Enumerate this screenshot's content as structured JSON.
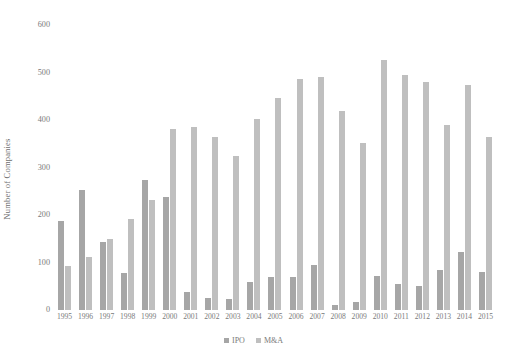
{
  "chart_data": {
    "type": "bar",
    "title": "",
    "xlabel": "",
    "ylabel": "Number of Companies",
    "ylim": [
      0,
      600
    ],
    "yticks": [
      0,
      100,
      200,
      300,
      400,
      500,
      600
    ],
    "grid": false,
    "legend_position": "bottom",
    "categories": [
      "1995",
      "1996",
      "1997",
      "1998",
      "1999",
      "2000",
      "2001",
      "2002",
      "2003",
      "2004",
      "2005",
      "2006",
      "2007",
      "2008",
      "2009",
      "2010",
      "2011",
      "2012",
      "2013",
      "2014",
      "2015"
    ],
    "series": [
      {
        "name": "IPO",
        "color": "#a6a6a6",
        "values": [
          187,
          253,
          143,
          78,
          273,
          238,
          37,
          26,
          24,
          59,
          70,
          70,
          95,
          10,
          17,
          72,
          54,
          50,
          85,
          122,
          80
        ]
      },
      {
        "name": "M&A",
        "color": "#bfbfbf",
        "values": [
          93,
          112,
          149,
          192,
          232,
          381,
          386,
          364,
          325,
          403,
          446,
          486,
          491,
          418,
          351,
          527,
          494,
          480,
          389,
          474,
          364
        ]
      }
    ]
  },
  "axes": {
    "y_title": "Number of Companies",
    "y_tick_labels": [
      "600",
      "500",
      "400",
      "300",
      "200",
      "100",
      "0"
    ],
    "x_tick_labels": [
      "1995",
      "1996",
      "1997",
      "1998",
      "1999",
      "2000",
      "2001",
      "2002",
      "2003",
      "2004",
      "2005",
      "2006",
      "2007",
      "2008",
      "2009",
      "2010",
      "2011",
      "2012",
      "2013",
      "2014",
      "2015"
    ]
  },
  "legend": {
    "items": [
      {
        "label": "IPO",
        "color": "#a6a6a6"
      },
      {
        "label": "M&A",
        "color": "#bfbfbf"
      }
    ]
  }
}
